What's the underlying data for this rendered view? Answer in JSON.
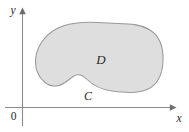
{
  "figure": {
    "background_color": "#ffffff",
    "width": 189,
    "height": 132
  },
  "axes": {
    "x_axis": {
      "label": "x",
      "arrow": "right-arrow-icon",
      "color": "#8a8a8a"
    },
    "y_axis": {
      "label": "y",
      "arrow": "up-arrow-icon",
      "color": "#8a8a8a"
    },
    "origin": {
      "label": "0"
    }
  },
  "region": {
    "label": "D",
    "fill_color": "#dedede",
    "stroke_color": "#9a9a9a"
  },
  "curve": {
    "label": "C",
    "description": "closed boundary curve of region D"
  }
}
